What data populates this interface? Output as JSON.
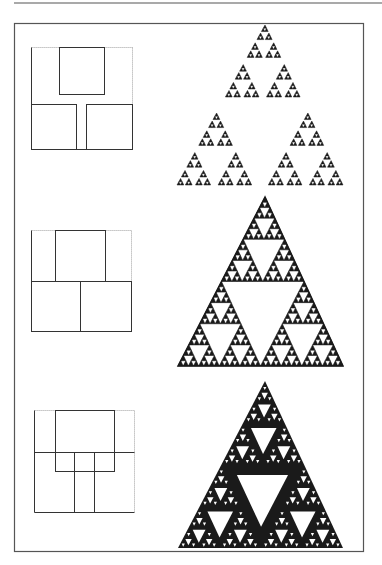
{
  "page": {
    "width": 382,
    "height": 565,
    "background": "#ffffff",
    "ink": "#1a1a1a",
    "frame_color": "#555555",
    "rule_color": "#555555"
  },
  "top_rule": {
    "x1": 14,
    "x2": 382,
    "y": 3
  },
  "frame": {
    "x": 14,
    "y": 23,
    "w": 349,
    "h": 528
  },
  "rows": [
    {
      "id": "row-1",
      "diagram": {
        "outer": {
          "x": 31,
          "y": 47,
          "w": 101,
          "h": 102,
          "dotted_sides": [
            "top",
            "right"
          ]
        },
        "rects": [
          {
            "x": 59,
            "y": 47,
            "w": 45,
            "h": 47
          },
          {
            "x": 31,
            "y": 104,
            "w": 45,
            "h": 45
          },
          {
            "x": 86,
            "y": 104,
            "w": 46,
            "h": 45
          }
        ],
        "lines": []
      },
      "fractal": {
        "kind": "sparse",
        "apex": [
          265,
          25
        ],
        "base_y": 185,
        "base_x": [
          177,
          343
        ],
        "ratio": 0.45,
        "depth": 4
      }
    },
    {
      "id": "row-2",
      "diagram": {
        "outer": {
          "x": 31,
          "y": 230,
          "w": 100,
          "h": 101,
          "dotted_sides": [
            "top",
            "right"
          ]
        },
        "rects": [
          {
            "x": 55,
            "y": 230,
            "w": 50,
            "h": 51
          },
          {
            "x": 31,
            "y": 281,
            "w": 49,
            "h": 50
          },
          {
            "x": 80,
            "y": 281,
            "w": 51,
            "h": 50
          }
        ],
        "lines": []
      },
      "fractal": {
        "kind": "standard",
        "apex": [
          265,
          197
        ],
        "base_y": 366,
        "base_x": [
          178,
          343
        ],
        "ratio": 0.5,
        "depth": 5
      }
    },
    {
      "id": "row-3",
      "diagram": {
        "outer": {
          "x": 34,
          "y": 410,
          "w": 100,
          "h": 102,
          "dotted_sides": [
            "top",
            "right"
          ]
        },
        "rects": [
          {
            "x": 55,
            "y": 410,
            "w": 59,
            "h": 61
          }
        ],
        "lines": [
          {
            "x1": 34,
            "y1": 452,
            "x2": 134,
            "y2": 452
          },
          {
            "x1": 74,
            "y1": 452,
            "x2": 74,
            "y2": 512
          },
          {
            "x1": 94,
            "y1": 452,
            "x2": 94,
            "y2": 512
          }
        ]
      },
      "fractal": {
        "kind": "overlapping",
        "apex": [
          265,
          381
        ],
        "base_y": 548,
        "base_x": [
          178,
          343
        ],
        "hole_factor": 0.62,
        "depth": 5
      }
    }
  ]
}
